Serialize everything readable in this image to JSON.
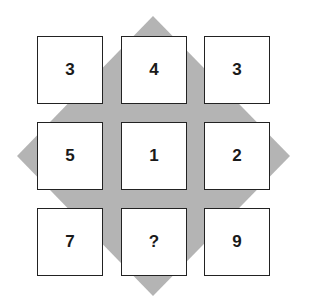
{
  "puzzle": {
    "grid": [
      [
        "3",
        "4",
        "3"
      ],
      [
        "5",
        "1",
        "2"
      ],
      [
        "7",
        "?",
        "9"
      ]
    ],
    "cells": [
      {
        "row": 0,
        "col": 0,
        "value": "3"
      },
      {
        "row": 0,
        "col": 1,
        "value": "4"
      },
      {
        "row": 0,
        "col": 2,
        "value": "3"
      },
      {
        "row": 1,
        "col": 0,
        "value": "5"
      },
      {
        "row": 1,
        "col": 1,
        "value": "1"
      },
      {
        "row": 1,
        "col": 2,
        "value": "2"
      },
      {
        "row": 2,
        "col": 0,
        "value": "7"
      },
      {
        "row": 2,
        "col": 1,
        "value": "?"
      },
      {
        "row": 2,
        "col": 2,
        "value": "9"
      }
    ],
    "background_shape": "diamond",
    "colors": {
      "diamond": "#b4b4b4",
      "cell_fill": "#ffffff",
      "cell_border": "#222222",
      "text": "#1a1a1a"
    }
  }
}
